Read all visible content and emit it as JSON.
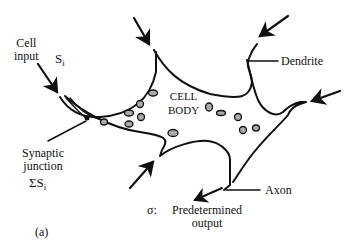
{
  "figure": {
    "panel_label": "(a)",
    "cell_body_label": [
      "CELL",
      "BODY"
    ],
    "labels": {
      "cell_input": [
        "Cell",
        "input"
      ],
      "input_symbol": "S",
      "input_subscript": "i",
      "dendrite": "Dendrite",
      "synaptic_junction": [
        "Synaptic",
        "junction"
      ],
      "sum_symbol": "ΣS",
      "sum_subscript": "i",
      "axon": "Axon",
      "output_symbol": "σ:",
      "output_text": [
        "Predetermined",
        "output"
      ]
    },
    "colors": {
      "ink": "#111111",
      "organelle_fill": "#aaaaaa",
      "background": "#ffffff"
    }
  }
}
